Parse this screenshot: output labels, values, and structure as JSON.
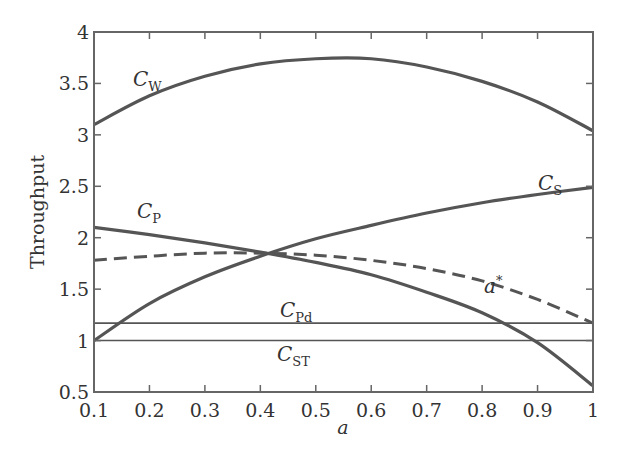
{
  "chart_data": {
    "type": "line",
    "title": "",
    "xlabel": "a",
    "ylabel": "Throughput",
    "xlim": [
      0.1,
      1
    ],
    "ylim": [
      0.5,
      4
    ],
    "x_ticks": [
      0.1,
      0.2,
      0.3,
      0.4,
      0.5,
      0.6,
      0.7,
      0.8,
      0.9,
      1
    ],
    "x_tick_labels": [
      "0.1",
      "0.2",
      "0.3",
      "0.4",
      "0.5",
      "0.6",
      "0.7",
      "0.8",
      "0.9",
      "1"
    ],
    "y_ticks": [
      0.5,
      1,
      1.5,
      2,
      2.5,
      3,
      3.5,
      4
    ],
    "y_tick_labels": [
      "0.5",
      "1",
      "1.5",
      "2",
      "2.5",
      "3",
      "3.5",
      "4"
    ],
    "grid": false,
    "legend": "inline labels",
    "x": [
      0.1,
      0.2,
      0.3,
      0.4,
      0.5,
      0.6,
      0.7,
      0.8,
      0.9,
      1.0
    ],
    "series": [
      {
        "name": "C_W",
        "label_main": "C",
        "label_sub": "W",
        "style": "solid-thick",
        "values": [
          3.1,
          3.38,
          3.57,
          3.69,
          3.74,
          3.74,
          3.66,
          3.52,
          3.32,
          3.04
        ]
      },
      {
        "name": "C_S",
        "label_main": "C",
        "label_sub": "S",
        "style": "solid-thick",
        "values": [
          1.0,
          1.36,
          1.62,
          1.82,
          1.99,
          2.12,
          2.24,
          2.34,
          2.42,
          2.49
        ]
      },
      {
        "name": "C_P",
        "label_main": "C",
        "label_sub": "P",
        "style": "solid-thick",
        "values": [
          2.1,
          2.03,
          1.95,
          1.86,
          1.76,
          1.64,
          1.47,
          1.27,
          0.98,
          0.56
        ]
      },
      {
        "name": "a*",
        "label_main": "a",
        "label_sub": "*",
        "style": "dashed",
        "values": [
          1.78,
          1.82,
          1.85,
          1.85,
          1.83,
          1.78,
          1.7,
          1.58,
          1.4,
          1.17
        ]
      },
      {
        "name": "C_Pd",
        "label_main": "C",
        "label_sub": "Pd",
        "style": "solid-thin",
        "values": [
          1.17,
          1.17,
          1.17,
          1.17,
          1.17,
          1.17,
          1.17,
          1.17,
          1.17,
          1.17
        ]
      },
      {
        "name": "C_ST",
        "label_main": "C",
        "label_sub": "ST",
        "style": "solid-thin",
        "values": [
          1.0,
          1.0,
          1.0,
          1.0,
          1.0,
          1.0,
          1.0,
          1.0,
          1.0,
          1.0
        ]
      }
    ]
  },
  "colors": {
    "line": "#555555",
    "frame": "#666666",
    "text": "#333333"
  }
}
